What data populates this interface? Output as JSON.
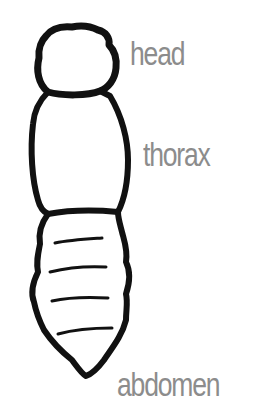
{
  "diagram": {
    "labels": {
      "head": "head",
      "thorax": "thorax",
      "abdomen": "abdomen"
    },
    "colors": {
      "outline": "#111111",
      "label": "#8c8c8c",
      "background": "#ffffff"
    },
    "parts": [
      "head",
      "thorax",
      "abdomen"
    ],
    "abdomen_segment_lines": 4
  }
}
